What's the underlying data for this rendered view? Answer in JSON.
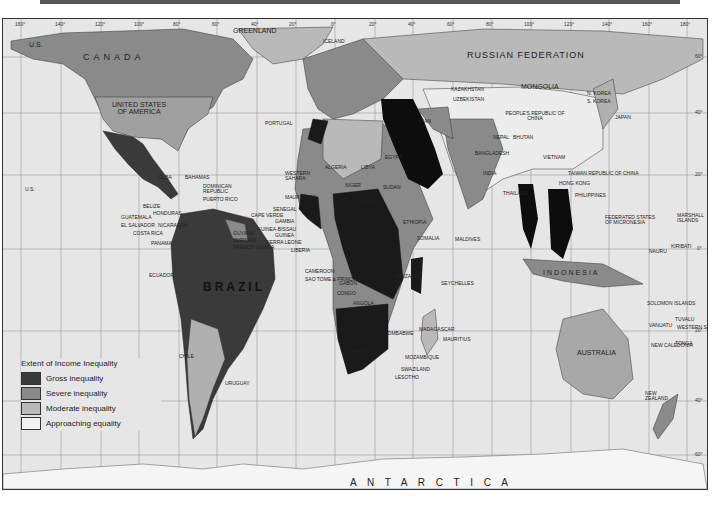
{
  "map": {
    "title": "Extent of Income Inequality",
    "colors": {
      "gross": "#3a3a3a",
      "severe": "#8a8a8a",
      "moderate": "#b9b9b9",
      "approaching": "#ececec",
      "ocean": "#e6e6e6",
      "black": "#0d0d0d"
    },
    "legend": {
      "title": "Extent of Income Inequality",
      "items": [
        {
          "label": "Gross inequality",
          "color": "#3a3a3a"
        },
        {
          "label": "Severe inequality",
          "color": "#8a8a8a"
        },
        {
          "label": "Moderate inequality",
          "color": "#b9b9b9"
        },
        {
          "label": "Approaching equality",
          "color": "#f2f2f2"
        }
      ]
    },
    "longitude_ticks": [
      "160°",
      "140°",
      "120°",
      "100°",
      "80°",
      "60°",
      "40°",
      "20°",
      "0°",
      "20°",
      "40°",
      "60°",
      "80°",
      "100°",
      "120°",
      "140°",
      "160°",
      "180°"
    ],
    "latitude_ticks": [
      "60°",
      "40°",
      "20°",
      "0°",
      "20°",
      "40°",
      "60°"
    ],
    "labels": {
      "greenland": "GREENLAND",
      "iceland": "ICELAND",
      "us_alaska": "U.S.",
      "canada": "C A N A D A",
      "usa": "UNITED STATES OF AMERICA",
      "us_hawaii": "U.S.",
      "mexico": "MEXICO",
      "cuba": "CUBA",
      "bahamas": "BAHAMAS",
      "dominican": "DOMINICAN REPUBLIC",
      "puerto_rico": "PUERTO RICO",
      "antigua": "ANTIGUA AND BARBUDA",
      "dominica": "DOMINICA",
      "st_lucia": "ST LUCIA",
      "barbados": "BARBADOS",
      "grenada": "GRENADA",
      "trinidad": "TRINIDAD & TOBAGO",
      "st_vincent": "ST VINCENT",
      "jamaica": "JAMAICA",
      "belize": "BELIZE",
      "honduras": "HONDURAS",
      "guatemala": "GUATEMALA",
      "el_salvador": "EL SALVADOR",
      "nicaragua": "NICARAGUA",
      "costa_rica": "COSTA RICA",
      "panama": "PANAMA",
      "venezuela": "VENEZUELA",
      "guyana": "GUYANA",
      "surinam": "SURINAM",
      "french_guiana": "FRENCH GUIANA",
      "colombia": "COLOMBIA",
      "ecuador": "ECUADOR",
      "peru": "PERU",
      "brazil": "BRAZIL",
      "bolivia": "BOLIVIA",
      "chile": "CHILE",
      "argentina": "ARGENTINA",
      "uruguay": "URUGUAY",
      "paraguay": "PARAGUAY",
      "ireland": "IRELAND",
      "portugal": "PORTUGAL",
      "western_sahara": "WESTERN SAHARA",
      "mauritania": "MAURITANIA",
      "senegal": "SENEGAL",
      "cape_verde": "CAPE VERDE",
      "gambia": "GAMBIA",
      "guinea_bissau": "GUINEA-BISSAU",
      "guinea": "GUINEA",
      "sierra_leone": "SIERRA LEONE",
      "liberia": "LIBERIA",
      "ivory_coast": "IVORY COAST",
      "togo": "TOGO",
      "benin": "BENIN",
      "cameroon": "CAMEROON",
      "eq_guinea": "EQUATORIAL GUINEA",
      "sao_tome": "SAO TOME & PRINCIPE",
      "gabon": "GABON",
      "congo": "CONGO",
      "algeria": "ALGERIA",
      "libya": "LIBYA",
      "egypt": "EGYPT",
      "mali": "MALI",
      "niger": "NIGER",
      "chad": "CHAD",
      "sudan": "SUDAN",
      "burkina": "BURKINA FASO",
      "ethiopia": "ETHIOPIA",
      "somalia": "SOMALIA",
      "tanzania": "TANZANIA",
      "angola": "ANGOLA",
      "namibia": "NAMIBIA",
      "zimbabwe": "ZIMBABWE",
      "mozambique": "MOZAMBIQUE",
      "madagascar": "MADAGASCAR",
      "mauritius": "MAURITIUS",
      "swaziland": "SWAZILAND",
      "lesotho": "LESOTHO",
      "comoros": "COMOROS",
      "malawi": "MALAWI",
      "seychelles": "SEYCHELLES",
      "maldives": "MALDIVES",
      "russia": "RUSSIAN FEDERATION",
      "latvia": "LATVIA",
      "lithuania": "LITHUANIA",
      "poland": "POLAND",
      "kazakhstan": "KAZAKHSTAN",
      "uzbekistan": "UZBEKISTAN",
      "kyrgyzstan": "KYRGYZSTAN",
      "tajikistan": "TAJIKISTAN",
      "turkmenistan": "TURKMENISTAN",
      "afghanistan": "AFGHANISTAN",
      "pakistan": "PAKISTAN",
      "iran": "IRAN",
      "iraq": "IRAQ",
      "kuwait": "KUWAIT",
      "oman": "OMAN",
      "mongolia": "MONGOLIA",
      "china": "PEOPLE'S REPUBLIC OF CHINA",
      "nepal": "NEPAL",
      "bhutan": "BHUTAN",
      "bangladesh": "BANGLADESH",
      "india": "INDIA",
      "sri_lanka": "SRI LANKA",
      "thailand": "THAILAND",
      "laos": "LAOS",
      "vietnam": "VIETNAM",
      "cambodia": "CAMBODIA",
      "malaysia": "MALAYSIA",
      "brunei": "BRUNEI",
      "singapore": "SINGAPORE",
      "philippines": "PHILIPPINES",
      "taiwan": "TAIWAN REPUBLIC OF CHINA",
      "hong_kong": "HONG KONG",
      "macao": "MACAO",
      "korea_n": "N. KOREA",
      "korea_s": "S. KOREA",
      "japan": "JAPAN",
      "indonesia": "INDONESIA",
      "micronesia": "FEDERATED STATES OF MICRONESIA",
      "marshall": "MARSHALL ISLANDS",
      "kiribati": "KIRIBATI",
      "nauru": "NAURU",
      "png": "PAPUA NEW GUINEA",
      "solomon": "SOLOMON ISLANDS",
      "vanuatu": "VANUATU",
      "fiji": "FIJI",
      "tuvalu": "TUVALU",
      "western_samoa": "WESTERN SAMOA",
      "tonga": "TONGA",
      "new_caledonia": "NEW CALEDONIA",
      "australia": "AUSTRALIA",
      "new_zealand": "NEW ZEALAND",
      "antarctica": "A N T A R C T I C A"
    }
  }
}
